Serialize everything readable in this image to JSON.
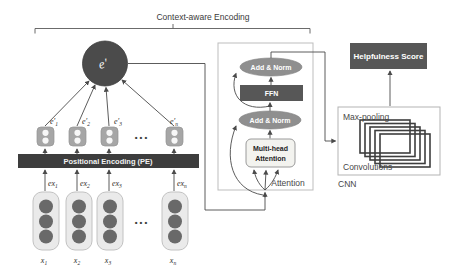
{
  "title": "Context-aware Encoding",
  "encoder": {
    "context_vector_label": "e′",
    "pe_bar_label": "Positional Encoding (PE)",
    "ellipsis": "•••",
    "columns": [
      {
        "e_base": "e′",
        "e_sub": "1",
        "ex_base": "ex",
        "ex_sub": "1",
        "x_base": "x",
        "x_sub": "1"
      },
      {
        "e_base": "e′",
        "e_sub": "2",
        "ex_base": "ex",
        "ex_sub": "2",
        "x_base": "x",
        "x_sub": "2"
      },
      {
        "e_base": "e′",
        "e_sub": "3",
        "ex_base": "ex",
        "ex_sub": "3",
        "x_base": "x",
        "x_sub": "3"
      },
      {
        "e_base": "e′",
        "e_sub": "n",
        "ex_base": "ex",
        "ex_sub": "n",
        "x_base": "x",
        "x_sub": "n"
      }
    ]
  },
  "attention": {
    "box_label": "Attention",
    "add_norm_top": "Add & Norm",
    "ffn": "FFN",
    "add_norm_bottom": "Add & Norm",
    "mha_line1": "Multi-head",
    "mha_line2": "Attention"
  },
  "cnn": {
    "box_label": "CNN",
    "max_pooling": "Max-pooling",
    "convolutions": "Convolutions"
  },
  "output": {
    "score_label": "Helpfulness Score"
  },
  "colors": {
    "dark_block": "#575757",
    "pe_bar": "#3d3d3d",
    "context_circle": "#4b4b4b",
    "ellipse_gray": "#8f8f8f",
    "embedding_square": "#a6a6a6",
    "vector_fill": "#eaeaea",
    "vector_dot": "#696969",
    "wire": "#4a4a4a"
  }
}
